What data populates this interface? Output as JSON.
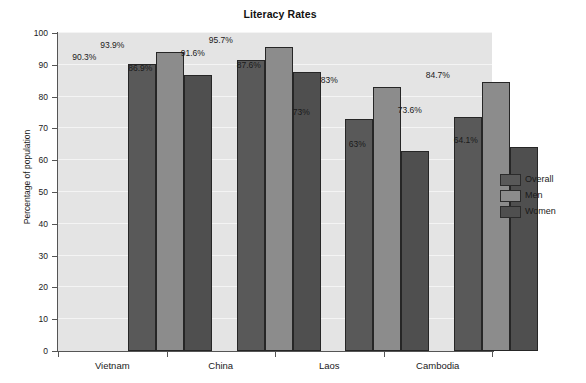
{
  "chart_data": {
    "type": "bar",
    "title": "Literacy Rates",
    "xlabel": "",
    "ylabel": "Percentage of population",
    "categories": [
      "Vietnam",
      "China",
      "Laos",
      "Cambodia"
    ],
    "series": [
      {
        "name": "Overall",
        "color": "#595959",
        "values": [
          90.3,
          91.6,
          73,
          73.6
        ],
        "labels": [
          "90.3%",
          "91.6%",
          "73%",
          "73.6%"
        ]
      },
      {
        "name": "Men",
        "color": "#8c8c8c",
        "values": [
          93.9,
          95.7,
          83,
          84.7
        ],
        "labels": [
          "93.9%",
          "95.7%",
          "83%",
          "84.7%"
        ]
      },
      {
        "name": "Women",
        "color": "#4f4f4f",
        "values": [
          86.9,
          87.6,
          63,
          64.1
        ],
        "labels": [
          "86.9%",
          "87.6%",
          "63%",
          "64.1%"
        ]
      }
    ],
    "ylim": [
      0,
      100
    ],
    "yticks": [
      0,
      10,
      20,
      30,
      40,
      50,
      60,
      70,
      80,
      90,
      100
    ],
    "ytick_labels": [
      "0",
      "10",
      "20",
      "30",
      "40",
      "50",
      "60",
      "70",
      "80",
      "90",
      "100"
    ],
    "grid": true,
    "gridline_color": "#f4f4f4",
    "plot_background": "#e4e4e4",
    "legend_position": "right",
    "legend_entries": [
      "Overall",
      "Men",
      "Women"
    ]
  },
  "legend": {
    "items": [
      {
        "label": "Overall"
      },
      {
        "label": "Men"
      },
      {
        "label": "Women"
      }
    ]
  }
}
